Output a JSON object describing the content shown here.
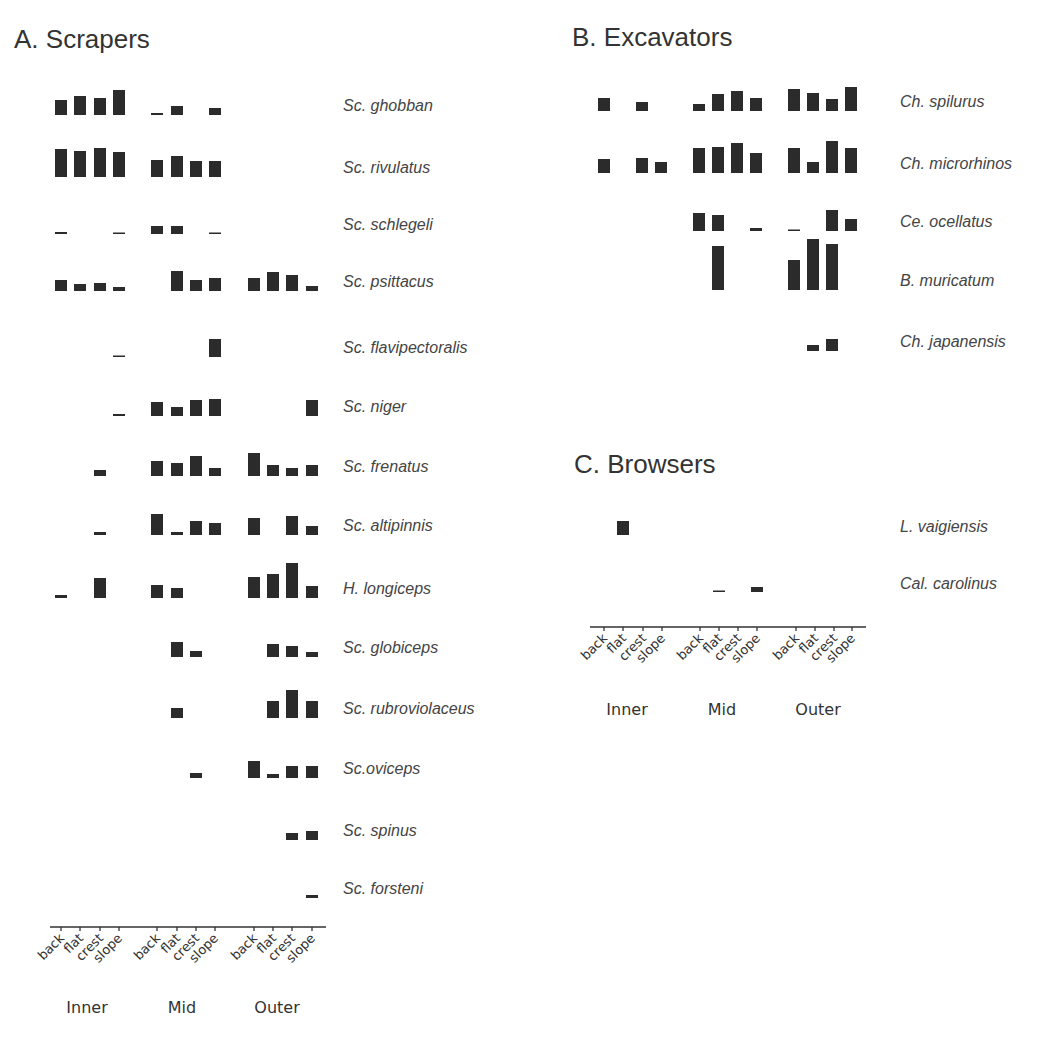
{
  "chart_data": [
    {
      "type": "bar",
      "panel": "A",
      "title": "A. Scrapers",
      "zones": [
        "Inner",
        "Mid",
        "Outer"
      ],
      "habitats": [
        "back",
        "flat",
        "crest",
        "slope"
      ],
      "categories": [
        "Inner back",
        "Inner flat",
        "Inner crest",
        "Inner slope",
        "Mid back",
        "Mid flat",
        "Mid crest",
        "Mid slope",
        "Outer back",
        "Outer flat",
        "Outer crest",
        "Outer slope"
      ],
      "series": [
        {
          "name": "Sc. ghobban",
          "values": [
            15,
            19,
            17,
            25,
            2,
            9,
            0,
            7,
            0,
            0,
            0,
            0
          ]
        },
        {
          "name": "Sc. rivulatus",
          "values": [
            28,
            26,
            29,
            25,
            17,
            21,
            16,
            16,
            0,
            0,
            0,
            0
          ]
        },
        {
          "name": "Sc. schlegeli",
          "values": [
            2,
            0,
            0,
            1,
            8,
            8,
            0,
            1,
            0,
            0,
            0,
            0
          ]
        },
        {
          "name": "Sc. psittacus",
          "values": [
            11,
            7,
            8,
            4,
            0,
            20,
            11,
            13,
            13,
            19,
            16,
            5
          ]
        },
        {
          "name": "Sc. flavipectoralis",
          "values": [
            0,
            0,
            0,
            1,
            0,
            0,
            0,
            18,
            0,
            0,
            0,
            0
          ]
        },
        {
          "name": "Sc. niger",
          "values": [
            0,
            0,
            0,
            2,
            14,
            9,
            16,
            17,
            0,
            0,
            0,
            16
          ]
        },
        {
          "name": "Sc. frenatus",
          "values": [
            0,
            0,
            6,
            0,
            15,
            13,
            20,
            8,
            23,
            11,
            8,
            11
          ]
        },
        {
          "name": "Sc. altipinnis",
          "values": [
            0,
            0,
            3,
            0,
            21,
            3,
            14,
            12,
            17,
            0,
            19,
            9
          ]
        },
        {
          "name": "H. longiceps",
          "values": [
            3,
            0,
            20,
            0,
            13,
            10,
            0,
            0,
            21,
            24,
            35,
            12
          ]
        },
        {
          "name": "Sc. globiceps",
          "values": [
            0,
            0,
            0,
            0,
            0,
            15,
            6,
            0,
            0,
            13,
            11,
            5
          ]
        },
        {
          "name": "Sc. rubroviolaceus",
          "values": [
            0,
            0,
            0,
            0,
            0,
            10,
            0,
            0,
            0,
            17,
            28,
            17
          ]
        },
        {
          "name": "Sc.oviceps",
          "values": [
            0,
            0,
            0,
            0,
            0,
            0,
            5,
            0,
            17,
            4,
            12,
            12
          ]
        },
        {
          "name": "Sc. spinus",
          "values": [
            0,
            0,
            0,
            0,
            0,
            0,
            0,
            0,
            0,
            0,
            7,
            9
          ]
        },
        {
          "name": "Sc. forsteni",
          "values": [
            0,
            0,
            0,
            0,
            0,
            0,
            0,
            0,
            0,
            0,
            0,
            3
          ]
        }
      ],
      "xlabel": "",
      "ylabel": "",
      "grid": false,
      "legend": "species labels right of each row"
    },
    {
      "type": "bar",
      "panel": "B",
      "title": "B. Excavators",
      "zones": [
        "Inner",
        "Mid",
        "Outer"
      ],
      "habitats": [
        "back",
        "flat",
        "crest",
        "slope"
      ],
      "categories": [
        "Inner back",
        "Inner flat",
        "Inner crest",
        "Inner slope",
        "Mid back",
        "Mid flat",
        "Mid crest",
        "Mid slope",
        "Outer back",
        "Outer flat",
        "Outer crest",
        "Outer slope"
      ],
      "series": [
        {
          "name": "Ch. spilurus",
          "values": [
            13,
            0,
            9,
            0,
            7,
            17,
            20,
            13,
            22,
            18,
            12,
            24
          ]
        },
        {
          "name": "Ch. microrhinos",
          "values": [
            14,
            0,
            15,
            11,
            25,
            26,
            30,
            20,
            25,
            11,
            32,
            25
          ]
        },
        {
          "name": "Ce. ocellatus",
          "values": [
            0,
            0,
            0,
            0,
            18,
            16,
            0,
            3,
            1,
            0,
            21,
            12
          ]
        },
        {
          "name": "B. muricatum",
          "values": [
            0,
            0,
            0,
            0,
            0,
            44,
            0,
            0,
            30,
            51,
            46,
            0
          ]
        },
        {
          "name": "Ch. japanensis",
          "values": [
            0,
            0,
            0,
            0,
            0,
            0,
            0,
            0,
            0,
            6,
            12,
            0
          ]
        }
      ],
      "xlabel": "",
      "ylabel": "",
      "grid": false
    },
    {
      "type": "bar",
      "panel": "C",
      "title": "C. Browsers",
      "zones": [
        "Inner",
        "Mid",
        "Outer"
      ],
      "habitats": [
        "back",
        "flat",
        "crest",
        "slope"
      ],
      "categories": [
        "Inner back",
        "Inner flat",
        "Inner crest",
        "Inner slope",
        "Mid back",
        "Mid flat",
        "Mid crest",
        "Mid slope",
        "Outer back",
        "Outer flat",
        "Outer crest",
        "Outer slope"
      ],
      "series": [
        {
          "name": "L. vaigiensis",
          "values": [
            0,
            14,
            0,
            0,
            0,
            0,
            0,
            0,
            0,
            0,
            0,
            0
          ]
        },
        {
          "name": "Cal. carolinus",
          "values": [
            0,
            0,
            0,
            0,
            0,
            1,
            0,
            5,
            0,
            0,
            0,
            0
          ]
        }
      ],
      "xlabel": "",
      "ylabel": "",
      "grid": false
    }
  ],
  "layout": {
    "bar_width": 12,
    "panels": [
      {
        "title_pos": [
          14,
          48
        ],
        "tick_x": [
          61,
          80,
          100,
          119,
          157,
          177,
          196,
          215,
          254,
          273,
          292,
          312
        ],
        "row_baselines": [
          115,
          177,
          234,
          291,
          357,
          416,
          476,
          535,
          598,
          657,
          718,
          778,
          840,
          898
        ],
        "label_x": 343,
        "label_offset": -4,
        "axis": {
          "y": 927,
          "x1": 50,
          "x2": 326,
          "group_x": [
            87,
            182,
            277
          ],
          "group_y": 1013
        }
      },
      {
        "title_pos": [
          572,
          46
        ],
        "tick_x": [
          604,
          623,
          642,
          661,
          699,
          718,
          737,
          756,
          794,
          813,
          832,
          851
        ],
        "row_baselines": [
          111,
          173,
          231,
          290,
          351
        ],
        "label_x": 900,
        "label_offset": -4,
        "axis": null
      },
      {
        "title_pos": [
          574,
          473
        ],
        "tick_x": [
          604,
          623,
          643,
          662,
          700,
          719,
          738,
          757,
          796,
          815,
          834,
          852
        ],
        "row_baselines": [
          535,
          592
        ],
        "label_x": 900,
        "label_offset": -3,
        "axis": {
          "y": 627,
          "x1": 590,
          "x2": 866,
          "group_x": [
            627,
            722,
            818
          ],
          "group_y": 715
        }
      }
    ]
  }
}
